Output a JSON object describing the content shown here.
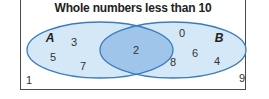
{
  "diagram": {
    "type": "venn",
    "title": "Whole numbers less than 10",
    "universe_label": "Whole numbers less than 10",
    "sets": [
      {
        "name": "A",
        "label": "A",
        "only": [
          "3",
          "5",
          "7"
        ]
      },
      {
        "name": "B",
        "label": "B",
        "only": [
          "0",
          "6",
          "8",
          "4"
        ]
      }
    ],
    "intersection": [
      "2"
    ],
    "outside": [
      "1",
      "9"
    ],
    "colors": {
      "set_fill": "#d4e8f7",
      "intersection_fill": "#9fc6ea",
      "outline": "#3b7cc0",
      "frame": "#4a4a4a"
    }
  },
  "labels": {
    "set_a": "A",
    "set_b": "B",
    "n3": "3",
    "n5": "5",
    "n7": "7",
    "n2": "2",
    "n0": "0",
    "n6": "6",
    "n8": "8",
    "n4": "4",
    "n1": "1",
    "n9": "9"
  }
}
